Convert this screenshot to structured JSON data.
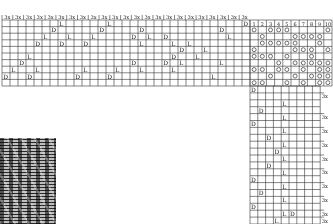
{
  "colors": {
    "line": "#333333",
    "text": "#222222",
    "paper": "#ffffff"
  },
  "threading": {
    "repeat_label": "3x",
    "repeat_count": 23,
    "rows": 10,
    "cols": 31,
    "origin": [
      2,
      20
    ],
    "cell": [
      8,
      6.6
    ],
    "marks": [
      {
        "c": 27,
        "r": 1,
        "t": "D"
      },
      {
        "c": 28,
        "r": 2,
        "t": "L"
      },
      {
        "c": 17,
        "r": 1,
        "t": "D"
      },
      {
        "c": 18,
        "r": 2,
        "t": "L"
      },
      {
        "c": 7,
        "r": 0,
        "t": "L"
      },
      {
        "c": 6,
        "r": 1,
        "t": "D"
      },
      {
        "c": 5,
        "r": 2,
        "t": "L"
      },
      {
        "c": 4,
        "r": 3,
        "t": "D"
      },
      {
        "c": 8,
        "r": 2,
        "t": "L"
      },
      {
        "c": 7,
        "r": 3,
        "t": "D"
      },
      {
        "c": 3,
        "r": 5,
        "t": "L"
      },
      {
        "c": 2,
        "r": 6,
        "t": "D"
      },
      {
        "c": 1,
        "r": 7,
        "t": "L"
      },
      {
        "c": 0,
        "r": 8,
        "t": "D"
      },
      {
        "c": 4,
        "r": 7,
        "t": "L"
      },
      {
        "c": 3,
        "r": 8,
        "t": "D"
      },
      {
        "c": 13,
        "r": 0,
        "t": "L"
      },
      {
        "c": 12,
        "r": 1,
        "t": "D"
      },
      {
        "c": 11,
        "r": 2,
        "t": "L"
      },
      {
        "c": 10,
        "r": 3,
        "t": "D"
      },
      {
        "c": 16,
        "r": 2,
        "t": "D"
      },
      {
        "c": 17,
        "r": 3,
        "t": "L"
      },
      {
        "c": 20,
        "r": 2,
        "t": "D"
      },
      {
        "c": 21,
        "r": 3,
        "t": "L"
      },
      {
        "c": 21,
        "r": 5,
        "t": "D"
      },
      {
        "c": 22,
        "r": 6,
        "t": "L"
      },
      {
        "c": 16,
        "r": 6,
        "t": "D"
      },
      {
        "c": 17,
        "r": 7,
        "t": "L"
      },
      {
        "c": 20,
        "r": 6,
        "t": "D"
      },
      {
        "c": 21,
        "r": 7,
        "t": "L"
      },
      {
        "c": 10,
        "r": 7,
        "t": "L"
      },
      {
        "c": 9,
        "r": 8,
        "t": "D"
      },
      {
        "c": 14,
        "r": 7,
        "t": "L"
      },
      {
        "c": 13,
        "r": 8,
        "t": "D"
      },
      {
        "c": 23,
        "r": 3,
        "t": "L"
      },
      {
        "c": 22,
        "r": 4,
        "t": "D"
      },
      {
        "c": 24,
        "r": 5,
        "t": "L"
      },
      {
        "c": 25,
        "r": 4,
        "t": "L"
      },
      {
        "c": 26,
        "r": 8,
        "t": "L"
      },
      {
        "c": 27,
        "r": 6,
        "t": "L"
      },
      {
        "c": 30,
        "r": 0,
        "t": "D"
      }
    ]
  },
  "tieup": {
    "header": [
      "1",
      "2",
      "3",
      "4",
      "5",
      "6",
      "7",
      "8",
      "9",
      "10"
    ],
    "rows": 10,
    "cols": 10,
    "origin": [
      250,
      20
    ],
    "cell": [
      8.2,
      6.6
    ],
    "marks": [
      [
        0,
        2,
        3,
        4,
        9
      ],
      [
        1,
        5,
        6,
        7,
        8
      ],
      [
        1,
        2,
        3,
        4,
        5,
        8
      ],
      [
        0,
        5,
        6,
        7,
        9
      ],
      [
        0,
        1,
        2,
        4,
        7
      ],
      [
        3,
        5,
        6,
        7,
        8,
        9
      ],
      [
        0,
        1,
        3,
        4,
        6,
        8,
        9
      ],
      [
        2,
        5,
        7,
        8,
        9
      ],
      [
        0,
        1,
        4,
        6,
        8,
        9
      ]
    ]
  },
  "treadling": {
    "repeat_label": "3x",
    "origin": [
      250,
      86
    ],
    "cell": [
      7.8,
      6.9
    ],
    "cols": 9,
    "rows": 20,
    "marks": [
      {
        "c": 0,
        "r": 0,
        "t": "D"
      },
      {
        "c": 4,
        "r": 2,
        "t": "L"
      },
      {
        "c": 1,
        "r": 3,
        "t": "D"
      },
      {
        "c": 4,
        "r": 4,
        "t": "L"
      },
      {
        "c": 0,
        "r": 5,
        "t": "D"
      },
      {
        "c": 4,
        "r": 6,
        "t": "L"
      },
      {
        "c": 2,
        "r": 7,
        "t": "D"
      },
      {
        "c": 4,
        "r": 8,
        "t": "L"
      },
      {
        "c": 3,
        "r": 9,
        "t": "D"
      },
      {
        "c": 4,
        "r": 10,
        "t": "L"
      },
      {
        "c": 2,
        "r": 11,
        "t": "D"
      },
      {
        "c": 4,
        "r": 12,
        "t": "L"
      },
      {
        "c": 0,
        "r": 13,
        "t": "D"
      },
      {
        "c": 4,
        "r": 14,
        "t": "L"
      },
      {
        "c": 1,
        "r": 15,
        "t": "D"
      },
      {
        "c": 4,
        "r": 16,
        "t": "L"
      },
      {
        "c": 0,
        "r": 17,
        "t": "D"
      },
      {
        "c": 4,
        "r": 18,
        "t": "L"
      },
      {
        "c": 5,
        "r": 18,
        "t": "D"
      },
      {
        "c": 3,
        "r": 19,
        "t": "L"
      }
    ],
    "repeat_rows": [
      1,
      4,
      6,
      8,
      10,
      12,
      14,
      16,
      18,
      19
    ]
  },
  "fabric_photo": {
    "label": "woven fabric sample"
  }
}
